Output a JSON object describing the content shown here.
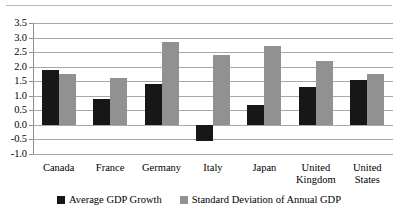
{
  "chart_data": {
    "type": "bar",
    "title": "",
    "xlabel": "",
    "ylabel": "",
    "ylim": [
      -1.0,
      3.5
    ],
    "ytick_step": 0.5,
    "grid": true,
    "legend_position": "bottom",
    "categories": [
      "Canada",
      "France",
      "Germany",
      "Italy",
      "Japan",
      "United\nKingdom",
      "United\nStates"
    ],
    "ytick_labels": [
      "3.5",
      "3.0",
      "2.5",
      "2.0",
      "1.5",
      "1.0",
      "0.5",
      "0.0",
      "-0.5",
      "-1.0"
    ],
    "ytick_values": [
      3.5,
      3.0,
      2.5,
      2.0,
      1.5,
      1.0,
      0.5,
      0.0,
      -0.5,
      -1.0
    ],
    "series": [
      {
        "name": "Average GDP Growth",
        "color": "#171717",
        "values": [
          1.9,
          0.9,
          1.4,
          -0.55,
          0.7,
          1.3,
          1.55
        ]
      },
      {
        "name": "Standard Deviation of Annual GDP",
        "color": "#919191",
        "values": [
          1.75,
          1.6,
          2.85,
          2.4,
          2.7,
          2.2,
          1.75
        ]
      }
    ]
  },
  "legend": {
    "entries": [
      {
        "label": "Average GDP Growth",
        "color": "#171717"
      },
      {
        "label": "Standard Deviation of Annual GDP",
        "color": "#919191"
      }
    ]
  }
}
